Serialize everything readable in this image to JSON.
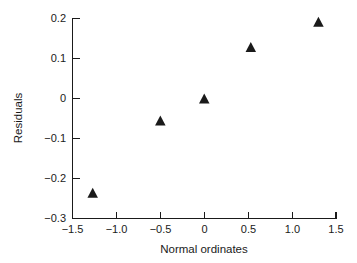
{
  "chart_data": {
    "type": "scatter",
    "title": "",
    "xlabel": "Normal ordinates",
    "ylabel": "Residuals",
    "xlim": [
      -1.5,
      1.5
    ],
    "ylim": [
      -0.3,
      0.2
    ],
    "xticks": [
      -1.5,
      -1.0,
      -0.5,
      0,
      0.5,
      1.0,
      1.5
    ],
    "xtick_labels": [
      "−1.5",
      "−1.0",
      "−0.5",
      "0",
      "0.5",
      "1.0",
      "1.5"
    ],
    "yticks": [
      0.2,
      0.1,
      0,
      -0.1,
      -0.2,
      -0.3
    ],
    "ytick_labels": [
      "0.2",
      "0.1",
      "0",
      "−0.1",
      "−0.2",
      "−0.3"
    ],
    "grid": false,
    "legend": null,
    "marker": "triangle-up",
    "marker_color": "#1a1a1a",
    "series": [
      {
        "name": "residuals",
        "points": [
          {
            "x": -1.27,
            "y": -0.238
          },
          {
            "x": -0.5,
            "y": -0.058
          },
          {
            "x": 0.0,
            "y": -0.003
          },
          {
            "x": 0.53,
            "y": 0.125
          },
          {
            "x": 1.3,
            "y": 0.188
          }
        ]
      }
    ]
  },
  "axes": {
    "x_title": "Normal ordinates",
    "y_title": "Residuals"
  }
}
